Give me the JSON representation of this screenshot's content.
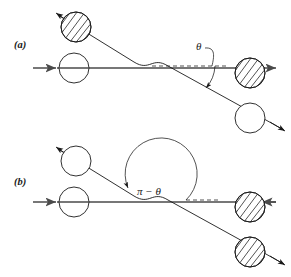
{
  "figure": {
    "background_color": "#ffffff",
    "ink_color": "#1a1a1a",
    "axis_color": "#4a4a4a",
    "dash_color": "#555555",
    "width": 291,
    "height": 277
  },
  "panels": [
    {
      "id": "a",
      "label": "(a)",
      "label_pos": {
        "x": 14,
        "y": 48
      },
      "angle_label": {
        "text": "θ",
        "name": "theta",
        "pos": {
          "x": 196,
          "y": 50
        }
      },
      "reference_line": {
        "name": "dashed-reference-line",
        "x1": 152,
        "y1": 66,
        "x2": 224,
        "y2": 66,
        "style": "dashed"
      },
      "beam_axis": {
        "name": "horizontal-beam-axis",
        "x1": 33,
        "y1": 68,
        "x2": 283,
        "y2": 68,
        "arrow": "right"
      },
      "incoming_arrow": {
        "name": "incoming-momentum-arrow",
        "x1": 33,
        "y1": 68,
        "x2": 57,
        "y2": 68,
        "direction": "right"
      },
      "trajectory": {
        "name": "deflected-particle-trajectory",
        "description": "straight incoming from upper-left, S-shaped deflection near centre, straight outgoing to lower-right",
        "start": {
          "x": 56,
          "y": 14
        },
        "end": {
          "x": 285,
          "y": 131
        }
      },
      "particles": [
        {
          "name": "upper-left-particle",
          "kind": "hatched",
          "cx": 76,
          "cy": 27,
          "r": 15
        },
        {
          "name": "left-target-particle",
          "kind": "open",
          "cx": 74,
          "cy": 68,
          "r": 15
        },
        {
          "name": "right-recoil-particle",
          "kind": "hatched",
          "cx": 250,
          "cy": 73,
          "r": 15
        },
        {
          "name": "lower-right-particle",
          "kind": "open",
          "cx": 250,
          "cy": 118,
          "r": 15
        }
      ]
    },
    {
      "id": "b",
      "label": "(b)",
      "label_pos": {
        "x": 14,
        "y": 185
      },
      "angle_label": {
        "text": "π − θ",
        "name": "pi-minus-theta",
        "pos": {
          "x": 150,
          "y": 193
        }
      },
      "reference_line": {
        "name": "dashed-reference-line",
        "x1": 186,
        "y1": 200,
        "x2": 218,
        "y2": 200,
        "style": "dashed"
      },
      "beam_axis": {
        "name": "horizontal-beam-axis",
        "x1": 33,
        "y1": 202,
        "x2": 283,
        "y2": 202,
        "arrow": "left"
      },
      "incoming_arrow": {
        "name": "incoming-momentum-arrow",
        "x1": 33,
        "y1": 202,
        "x2": 57,
        "y2": 202,
        "direction": "right"
      },
      "trajectory": {
        "name": "deflected-particle-trajectory",
        "description": "straight incoming from upper-left, S-shaped deflection near centre, straight outgoing to lower-right",
        "start": {
          "x": 56,
          "y": 148
        },
        "end": {
          "x": 285,
          "y": 265
        }
      },
      "particles": [
        {
          "name": "upper-left-particle",
          "kind": "open",
          "cx": 76,
          "cy": 161,
          "r": 15
        },
        {
          "name": "left-target-particle",
          "kind": "open",
          "cx": 74,
          "cy": 202,
          "r": 15
        },
        {
          "name": "right-recoil-particle",
          "kind": "hatched",
          "cx": 250,
          "cy": 207,
          "r": 15
        },
        {
          "name": "lower-right-particle",
          "kind": "hatched",
          "cx": 250,
          "cy": 252,
          "r": 15
        }
      ]
    }
  ]
}
